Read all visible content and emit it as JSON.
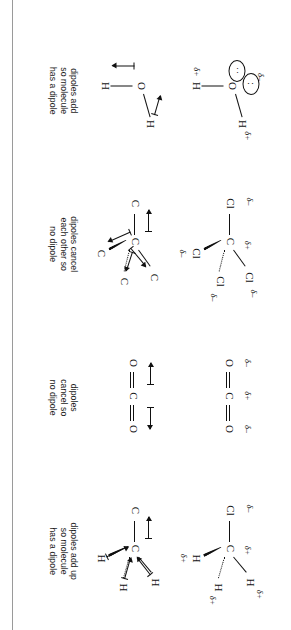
{
  "figure": {
    "columns": [
      {
        "id": "water",
        "molecule": "H2O",
        "charge_diagram": {
          "central_atom": "O",
          "atoms": [
            {
              "label": "H",
              "delta": "δ+"
            },
            {
              "label": "H",
              "delta": "δ+"
            }
          ],
          "central_delta": "δ–",
          "lone_pairs": 2,
          "lone_pair_dots": ":"
        },
        "arrow_diagram": {
          "central_atom": "O",
          "atoms": [
            "H",
            "H"
          ],
          "arrow_count": 2
        },
        "caption": [
          "dipoles add",
          "so molecule",
          "has a dipole"
        ]
      },
      {
        "id": "tetrachloromethane",
        "molecule": "CCl4",
        "charge_diagram": {
          "central_atom": "C",
          "central_delta": "δ+",
          "atoms": [
            {
              "label": "Cl",
              "delta": "δ–"
            },
            {
              "label": "Cl",
              "delta": "δ–"
            },
            {
              "label": "Cl",
              "delta": "δ–"
            },
            {
              "label": "Cl",
              "delta": "δ–"
            }
          ]
        },
        "arrow_diagram": {
          "central_atom": "C",
          "atoms": [
            "Cl",
            "Cl",
            "Cl",
            "Cl"
          ],
          "arrow_count": 4
        },
        "caption": [
          "dipoles cancel",
          "each other so",
          "no dipole"
        ]
      },
      {
        "id": "carbon-dioxide",
        "molecule": "CO2",
        "charge_diagram": {
          "central_atom": "C",
          "central_delta": "δ+",
          "atoms": [
            {
              "label": "O",
              "delta": "δ–"
            },
            {
              "label": "O",
              "delta": "δ–"
            }
          ],
          "bond_order": 2
        },
        "arrow_diagram": {
          "central_atom": "C",
          "atoms": [
            "O",
            "O"
          ],
          "arrow_count": 2
        },
        "caption": [
          "dipoles",
          "cancel so",
          "no dipole"
        ]
      },
      {
        "id": "chloromethane",
        "molecule": "CH3Cl",
        "charge_diagram": {
          "central_atom": "C",
          "central_delta": "δ+",
          "atoms": [
            {
              "label": "Cl",
              "delta": "δ–"
            },
            {
              "label": "H",
              "delta": "δ+"
            },
            {
              "label": "H",
              "delta": "δ+"
            },
            {
              "label": "H",
              "delta": "δ+"
            }
          ]
        },
        "arrow_diagram": {
          "central_atom": "C",
          "atoms": [
            "Cl",
            "H",
            "H",
            "H"
          ],
          "arrow_count": 4
        },
        "caption": [
          "dipoles add up",
          "so molecule",
          "has a dipole"
        ]
      }
    ]
  },
  "colors": {
    "ink": "#111111",
    "page": "#ffffff",
    "rule": "#9a9a9a"
  }
}
